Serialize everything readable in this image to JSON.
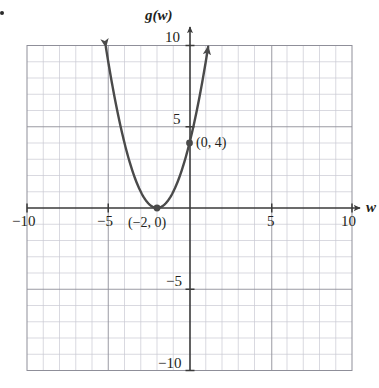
{
  "chart_data": {
    "type": "line",
    "title": "",
    "subtitle": "",
    "xlabel": "w",
    "ylabel": "g(w)",
    "xlim": [
      -10,
      10
    ],
    "ylim": [
      -10,
      10
    ],
    "grid": true,
    "grid_minor_step": 1,
    "grid_major_step": 5,
    "legend": "none",
    "x_ticks": [
      -10,
      -5,
      5,
      10
    ],
    "x_tick_labels": [
      "−10",
      "−5",
      "5",
      "10"
    ],
    "y_ticks": [
      -10,
      -5,
      5,
      10
    ],
    "y_tick_labels": [
      "−10",
      "−5",
      "5",
      "10"
    ],
    "series": [
      {
        "name": "g(w) = (w + 2)^2",
        "type": "parabola",
        "vertex": [
          -2,
          0
        ],
        "leading_coefficient": 1,
        "arrow_start": true,
        "arrow_end": true,
        "x_range": [
          -5.15,
          1.15
        ],
        "points": [
          [
            -5.15,
            9.92
          ],
          [
            -5.0,
            9.0
          ],
          [
            -4.5,
            6.25
          ],
          [
            -4.0,
            4.0
          ],
          [
            -3.5,
            2.25
          ],
          [
            -3.0,
            1.0
          ],
          [
            -2.5,
            0.25
          ],
          [
            -2.0,
            0.0
          ],
          [
            -1.5,
            0.25
          ],
          [
            -1.0,
            1.0
          ],
          [
            -0.5,
            2.25
          ],
          [
            0.0,
            4.0
          ],
          [
            0.5,
            6.25
          ],
          [
            1.0,
            9.0
          ],
          [
            1.15,
            9.92
          ]
        ]
      }
    ],
    "annotated_points": [
      {
        "label": "(0, 4)",
        "x": 0,
        "y": 4,
        "marker": "filled-circle"
      },
      {
        "label": "(−2, 0)",
        "x": -2,
        "y": 0,
        "marker": "filled-circle"
      }
    ],
    "colors": {
      "curve": "#4a4a4a",
      "axis": "#3a3a3a",
      "grid_minor": "#c8c8d0",
      "grid_major": "#8a8a92",
      "plot_border": "#8a8a92",
      "text": "#231f20",
      "background": "#ffffff"
    }
  }
}
